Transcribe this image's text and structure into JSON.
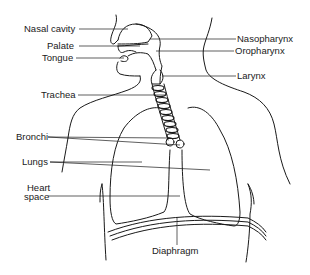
{
  "diagram": {
    "colors": {
      "line": "#1a1a1a",
      "background": "#ffffff"
    },
    "labels_left": [
      {
        "id": "nasal-cavity",
        "text": "Nasal cavity"
      },
      {
        "id": "palate",
        "text": "Palate"
      },
      {
        "id": "tongue",
        "text": "Tongue"
      },
      {
        "id": "trachea",
        "text": "Trachea"
      },
      {
        "id": "bronchi",
        "text": "Bronchi"
      },
      {
        "id": "lungs",
        "text": "Lungs"
      },
      {
        "id": "heart-space-line1",
        "text": "Heart"
      },
      {
        "id": "heart-space-line2",
        "text": "space"
      }
    ],
    "labels_right": [
      {
        "id": "nasopharynx",
        "text": "Nasopharynx"
      },
      {
        "id": "oropharynx",
        "text": "Oropharynx"
      },
      {
        "id": "larynx",
        "text": "Larynx"
      }
    ],
    "labels_bottom": [
      {
        "id": "diaphragm",
        "text": "Diaphragm"
      }
    ]
  }
}
